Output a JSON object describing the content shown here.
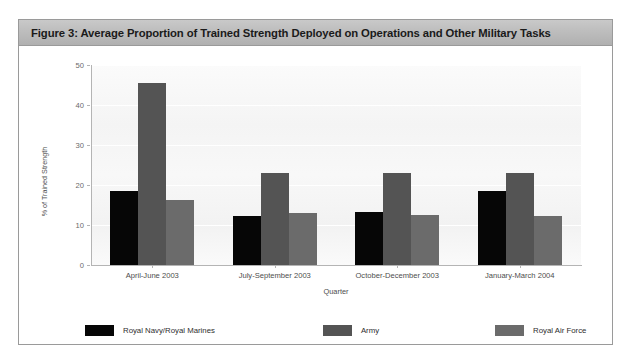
{
  "figure": {
    "title": "Figure 3: Average Proportion of Trained Strength Deployed on Operations and Other Military Tasks"
  },
  "chart_data": {
    "type": "bar",
    "title": "Figure 3: Average Proportion of Trained Strength Deployed on Operations and Other Military Tasks",
    "xlabel": "Quarter",
    "ylabel": "% of Trained Strength",
    "categories": [
      "April-June 2003",
      "July-September 2003",
      "October-December 2003",
      "January-March 2004"
    ],
    "series": [
      {
        "name": "Royal Navy/Royal Marines",
        "color": "#060606",
        "values": [
          18.5,
          12.3,
          13.3,
          18.4
        ]
      },
      {
        "name": "Army",
        "color": "#545454",
        "values": [
          45.5,
          23.0,
          23.0,
          23.0
        ]
      },
      {
        "name": "Royal Air Force",
        "color": "#6b6b6b",
        "values": [
          16.2,
          13.0,
          12.5,
          12.2
        ]
      }
    ],
    "ylim": [
      0,
      50
    ],
    "yticks": [
      0,
      10,
      20,
      30,
      40,
      50
    ],
    "grid": true,
    "legend_position": "bottom"
  }
}
